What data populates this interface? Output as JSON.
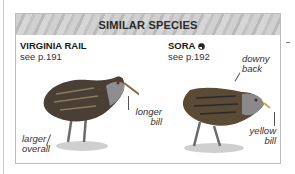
{
  "panel": {
    "title": "SIMILAR SPECIES"
  },
  "species": [
    {
      "name": "VIRGINIA RAIL",
      "see": "see p.191",
      "notes": {
        "bill": "longer\nbill",
        "size": "larger\noverall"
      }
    },
    {
      "name": "SORA",
      "icon": "half-filled-circle-icon",
      "see": "see p.192",
      "notes": {
        "back": "downy\nback",
        "bill": "yellow\nbill"
      }
    }
  ],
  "colors": {
    "header_band": "#c8c8c8",
    "border": "#bdbdbd",
    "text": "#1a1a1a"
  }
}
